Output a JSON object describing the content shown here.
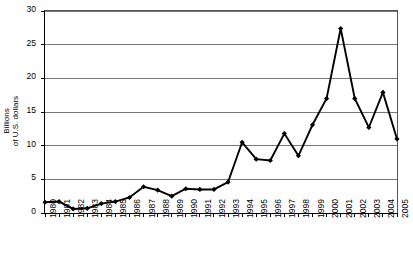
{
  "chart_data": {
    "type": "line",
    "title": "",
    "xlabel": "",
    "ylabel": "Billions of U.S. dollars",
    "ylabel_line1": "Billions",
    "ylabel_line2": "of U.S. dollars",
    "ylim": [
      0,
      30
    ],
    "yticks": [
      0,
      5,
      10,
      15,
      20,
      25,
      30
    ],
    "ytick_labels": [
      "0",
      "5",
      "10",
      "15",
      "20",
      "25",
      "30"
    ],
    "grid": true,
    "legend": "none",
    "marker": "diamond",
    "line_color": "#000000",
    "grid_color": "#777777",
    "categories": [
      "1980",
      "1981",
      "1982",
      "1983",
      "1984",
      "1985",
      "1986",
      "1987",
      "1988",
      "1989",
      "1990",
      "1991",
      "1992",
      "1993",
      "1994",
      "1995",
      "1996",
      "1997",
      "1998",
      "1999",
      "2000",
      "2001",
      "2002",
      "2003",
      "2004",
      "2005"
    ],
    "values": [
      1.6,
      1.7,
      0.6,
      0.7,
      1.4,
      1.7,
      2.3,
      3.9,
      3.4,
      2.5,
      3.6,
      3.5,
      3.5,
      4.6,
      10.5,
      8.0,
      7.8,
      11.8,
      8.5,
      13.1,
      17.0,
      27.4,
      17.0,
      12.7,
      17.9,
      11.0
    ]
  },
  "caption": {
    "text": ""
  }
}
